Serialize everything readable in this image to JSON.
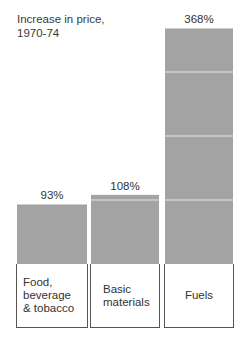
{
  "chart_data": {
    "type": "bar",
    "title": "Increase in price,\n1970-74",
    "xlabel": "",
    "ylabel": "",
    "categories": [
      "Food,\nbeverage\n& tobacco",
      "Basic\nmaterials",
      "Fuels"
    ],
    "values": [
      93,
      108,
      368
    ],
    "value_labels": [
      "93%",
      "108%",
      "368%"
    ],
    "ylim": [
      0,
      368
    ],
    "segment_step": 100,
    "grid": false,
    "legend": "none",
    "bar_color": "#a3a3a3",
    "segment_line_color": "#e6e6e6"
  }
}
